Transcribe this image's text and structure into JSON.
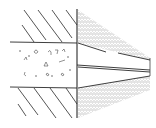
{
  "diagram": {
    "type": "cross-section line drawing",
    "colors": {
      "background": "#ffffff",
      "line": "#2a2a2a",
      "shading": "#9a9a9a"
    },
    "regions": [
      {
        "id": "upper-wall-hatch",
        "label": ""
      },
      {
        "id": "concrete-bore",
        "label": ""
      },
      {
        "id": "lower-wall-hatch",
        "label": ""
      },
      {
        "id": "upper-shaded-wedge",
        "label": ""
      },
      {
        "id": "center-slot",
        "label": ""
      },
      {
        "id": "lower-shaded-wedge",
        "label": ""
      }
    ]
  }
}
